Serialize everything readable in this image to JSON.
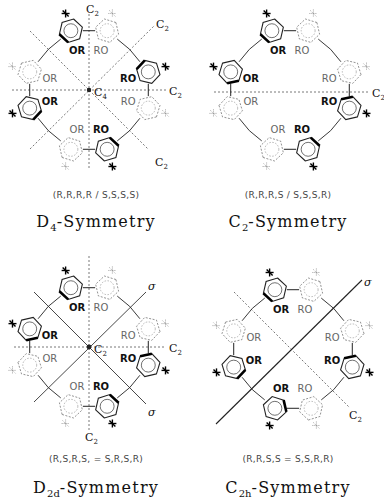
{
  "figure": {
    "panels": [
      {
        "id": "d4",
        "descriptor": "(R,R,R,R  /  S,S,S,S)",
        "symmetry_main": "D",
        "symmetry_sub": "4",
        "symmetry_suffix": "-Symmetry",
        "center_label_main": "C",
        "center_label_sub": "4",
        "axis_labels": [
          {
            "main": "C",
            "sub": "2",
            "pos": "top"
          },
          {
            "main": "C",
            "sub": "2",
            "pos": "upper-right"
          },
          {
            "main": "C",
            "sub": "2",
            "pos": "right"
          },
          {
            "main": "C",
            "sub": "2",
            "pos": "lower-right"
          }
        ]
      },
      {
        "id": "c2",
        "descriptor": "(R,R,R,S  /  S,S,S,R)",
        "symmetry_main": "C",
        "symmetry_sub": "2",
        "symmetry_suffix": "-Symmetry",
        "axis_labels": [
          {
            "main": "C",
            "sub": "2",
            "pos": "right"
          }
        ]
      },
      {
        "id": "d2d",
        "descriptor": "(R,S,R,S,  =  S,R,S,R)",
        "symmetry_main": "D",
        "symmetry_sub": "2d",
        "symmetry_suffix": "-Symmetry",
        "center_label_main": "C",
        "center_label_sub": "2",
        "axis_labels": [
          {
            "main": "σ",
            "sub": "",
            "pos": "upper-right"
          },
          {
            "main": "C",
            "sub": "2",
            "pos": "right"
          },
          {
            "main": "σ",
            "sub": "",
            "pos": "lower-right"
          },
          {
            "main": "C",
            "sub": "2",
            "pos": "bottom"
          }
        ]
      },
      {
        "id": "c2h",
        "descriptor": "(R,R,S,S  =  S,S,R,R)",
        "symmetry_main": "C",
        "symmetry_sub": "2h",
        "symmetry_suffix": "-Symmetry",
        "axis_labels": [
          {
            "main": "σ",
            "sub": "",
            "pos": "upper-right"
          },
          {
            "main": "C",
            "sub": "2",
            "pos": "lower-right"
          }
        ]
      }
    ],
    "substituent_labels": {
      "or": "OR",
      "ro": "RO"
    }
  }
}
